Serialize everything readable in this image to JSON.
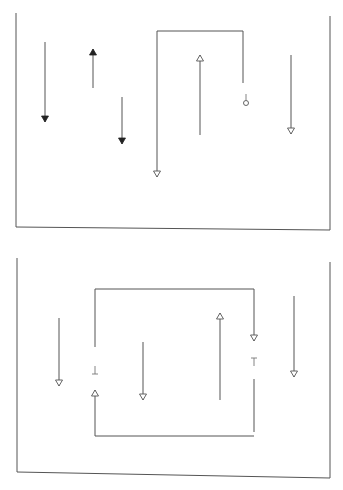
{
  "figure": {
    "type": "line-arrow diagram (scanned)",
    "colors": {
      "line": "#555555",
      "filled_head": "#222222",
      "background": "#ffffff"
    },
    "panels": [
      {
        "id": "top",
        "container": {
          "left_x": 16,
          "right_x": 330,
          "top_y_left": 13,
          "top_y_right": 16,
          "bottom_y_left": 227,
          "bottom_y_right": 230
        },
        "arrows": [
          {
            "x": 45,
            "y1": 42,
            "y2": 122,
            "direction": "down",
            "head": "filled"
          },
          {
            "x": 93,
            "y1": 88,
            "y2": 49,
            "direction": "up",
            "head": "filled"
          },
          {
            "x": 122,
            "y1": 97,
            "y2": 144,
            "direction": "down",
            "head": "filled"
          },
          {
            "x": 200,
            "y1": 135,
            "y2": 55,
            "direction": "up",
            "head": "open"
          },
          {
            "x": 291,
            "y1": 55,
            "y2": 134,
            "direction": "down",
            "head": "open"
          }
        ],
        "bracket": {
          "points": [
            [
              157,
              177
            ],
            [
              157,
              31
            ],
            [
              243,
              31
            ],
            [
              243,
              83
            ]
          ],
          "start_head": "open-down",
          "end_terminal": {
            "type": "circle",
            "cx": 246,
            "cy": 103,
            "r": 2.5,
            "stem_y1": 94
          }
        }
      },
      {
        "id": "bottom",
        "container": {
          "left_x": 17,
          "right_x": 330,
          "top_y_left": 258,
          "top_y_right": 262,
          "bottom_y_left": 472,
          "bottom_y_right": 478
        },
        "arrows": [
          {
            "x": 59,
            "y1": 318,
            "y2": 386,
            "direction": "down",
            "head": "open"
          },
          {
            "x": 143,
            "y1": 342,
            "y2": 400,
            "direction": "down",
            "head": "open"
          },
          {
            "x": 220,
            "y1": 400,
            "y2": 313,
            "direction": "up",
            "head": "open"
          },
          {
            "x": 294,
            "y1": 296,
            "y2": 377,
            "direction": "down",
            "head": "open"
          }
        ],
        "loop": {
          "top_y": 289,
          "bottom_y": 436,
          "left_x": 95,
          "right_x": 254,
          "right_upper": {
            "y1": 289,
            "y2": 341,
            "head": "open-down"
          },
          "right_mark": {
            "glyph": "T",
            "y": 362
          },
          "right_lower": {
            "y1": 379,
            "y2": 432
          },
          "left_lower": {
            "y1": 436,
            "y2": 390,
            "head": "open-up"
          },
          "left_mark": {
            "glyph": "⊥",
            "y": 370
          },
          "left_upper": {
            "y1": 289,
            "y2": 347
          }
        }
      }
    ]
  }
}
